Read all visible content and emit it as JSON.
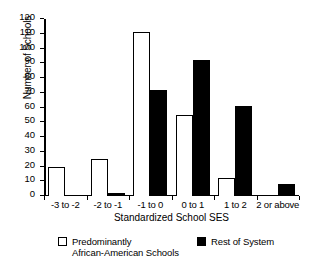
{
  "chart_data": {
    "type": "bar",
    "title": "",
    "xlabel": "Standardized School SES",
    "ylabel": "Number of Schools",
    "categories": [
      "-3 to -2",
      "-2 to -1",
      "-1 to 0",
      "0 to 1",
      "1 to 2",
      "2 or above"
    ],
    "series": [
      {
        "name": "Predominantly\nAfrican-American Schools",
        "color": "#ffffff",
        "values": [
          20,
          25,
          111,
          55,
          12,
          0
        ]
      },
      {
        "name": "Rest of System",
        "color": "#000000",
        "values": [
          0,
          2,
          72,
          92,
          61,
          8
        ]
      }
    ],
    "ylim": [
      0,
      120
    ],
    "ytick_labels": [
      "0",
      "10",
      "20",
      "30",
      "40",
      "50",
      "60",
      "70",
      "80",
      "90",
      "100",
      "110",
      "120"
    ],
    "ytick_values": [
      0,
      10,
      20,
      30,
      40,
      50,
      60,
      70,
      80,
      90,
      100,
      110,
      120
    ],
    "grid": false,
    "legend_position": "bottom"
  },
  "legend": {
    "entries": [
      {
        "label": "Predominantly\nAfrican-American Schools",
        "swatch": "white-square-outline"
      },
      {
        "label": "Rest of System",
        "swatch": "black-square-filled"
      }
    ]
  }
}
